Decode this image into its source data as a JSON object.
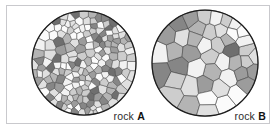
{
  "figure": {
    "background_color": "#ffffff",
    "frame_color": "#c9c9cd",
    "outline_color": "#1d1d1d",
    "grain_stroke_color": "#4a4a4a"
  },
  "palette": {
    "white": "#fbfbfb",
    "near_white": "#f2f2f2",
    "light": "#e0e0e0",
    "light_mid": "#cdcdcd",
    "mid": "#b4b4b4",
    "mid_dark": "#9c9c9c",
    "dark": "#868686",
    "darkest": "#6f6f6f"
  },
  "specimens": [
    {
      "id": "a",
      "name": "rock-a",
      "label_prefix": "rock ",
      "label_id": "A",
      "texture": "fine-grained",
      "circle": {
        "cx": 65,
        "cy": 57,
        "r": 52
      },
      "grain_count": 190,
      "seed": 20461,
      "relax_iterations": 3,
      "shade_weights": [
        0.17,
        0.15,
        0.16,
        0.13,
        0.13,
        0.1,
        0.09,
        0.07
      ]
    },
    {
      "id": "b",
      "name": "rock-b",
      "label_prefix": "rock ",
      "label_id": "B",
      "texture": "coarse-grained",
      "circle": {
        "cx": 65,
        "cy": 57,
        "r": 53
      },
      "grain_count": 46,
      "seed": 7734,
      "relax_iterations": 4,
      "shade_weights": [
        0.2,
        0.16,
        0.14,
        0.12,
        0.12,
        0.1,
        0.09,
        0.07
      ]
    }
  ],
  "chart_data": {
    "type": "diagram",
    "items": [
      {
        "label": "rock A",
        "crystal_count": 190,
        "description": "fine-grained: many small interlocking crystals"
      },
      {
        "label": "rock B",
        "crystal_count": 46,
        "description": "coarse-grained: few large interlocking crystals"
      }
    ]
  }
}
